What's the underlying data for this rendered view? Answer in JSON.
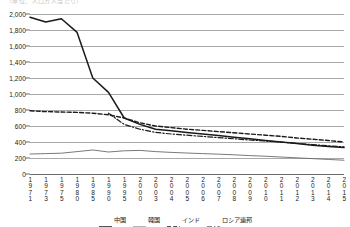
{
  "title_fragment": "（単位：人口万人当たり）",
  "chart_data": {
    "type": "line",
    "title": "",
    "xlabel": "",
    "ylabel": "",
    "ylim": [
      0,
      2000
    ],
    "ytick_step": 200,
    "yticks": [
      "0",
      "200",
      "400",
      "600",
      "800",
      "1,000",
      "1,200",
      "1,400",
      "1,600",
      "1,800",
      "2,000"
    ],
    "grid": true,
    "legend_position": "bottom",
    "categories": [
      "1971",
      "1973",
      "1975",
      "1980",
      "1985",
      "1990",
      "1995",
      "2000",
      "2003",
      "2004",
      "2005",
      "2006",
      "2007",
      "2008",
      "2009",
      "2010",
      "2011",
      "2012",
      "2013",
      "2014",
      "2015"
    ],
    "series": [
      {
        "name": "中国",
        "style": "solid",
        "color": "#1a1a1a",
        "values": [
          1960,
          1900,
          1940,
          1770,
          1200,
          1020,
          700,
          620,
          560,
          540,
          520,
          500,
          480,
          460,
          440,
          420,
          400,
          380,
          360,
          345,
          330
        ]
      },
      {
        "name": "韓国",
        "style": "solid-thin",
        "color": "#6a6a6a",
        "values": [
          250,
          255,
          260,
          280,
          300,
          275,
          290,
          295,
          280,
          270,
          262,
          255,
          248,
          240,
          230,
          222,
          212,
          202,
          192,
          182,
          172
        ]
      },
      {
        "name": "インド",
        "style": "dashed",
        "color": "#1a1a1a",
        "values": [
          790,
          780,
          775,
          770,
          760,
          740,
          700,
          640,
          600,
          580,
          560,
          545,
          530,
          515,
          500,
          485,
          470,
          450,
          435,
          418,
          400
        ]
      },
      {
        "name": "ロシア連邦",
        "style": "dash-dot",
        "color": "#1a1a1a",
        "values": [
          null,
          null,
          null,
          null,
          null,
          760,
          620,
          560,
          520,
          500,
          485,
          470,
          455,
          440,
          425,
          412,
          398,
          382,
          368,
          352,
          338
        ]
      }
    ]
  }
}
